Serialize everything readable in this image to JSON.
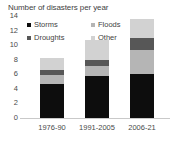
{
  "chart_data": {
    "type": "bar",
    "subtype": "stacked-bar",
    "title": "Number of disasters per year",
    "xlabel": "",
    "ylabel": "",
    "categories": [
      "1976-90",
      "1991-2005",
      "2006-21"
    ],
    "series": [
      {
        "name": "Storms",
        "color": "#0d0d0d",
        "values": [
          4.7,
          5.7,
          6.0
        ]
      },
      {
        "name": "Floods",
        "color": "#b5b5b5",
        "values": [
          1.2,
          1.4,
          3.4
        ]
      },
      {
        "name": "Droughts",
        "color": "#575757",
        "values": [
          0.7,
          0.8,
          1.6
        ]
      },
      {
        "name": "Other",
        "color": "#d2d2d2",
        "values": [
          1.6,
          2.8,
          2.6
        ]
      }
    ],
    "totals": [
      8.2,
      10.7,
      13.6
    ],
    "ylim": [
      0,
      14
    ],
    "yticks": [
      0,
      2,
      4,
      6,
      8,
      10,
      12,
      14
    ],
    "ytick_labels": [
      "0",
      "2",
      "4",
      "6",
      "8",
      "10",
      "12",
      "14"
    ],
    "grid": false,
    "legend_position": "inside-top-left",
    "legend_entries": [
      "Storms",
      "Floods",
      "Droughts",
      "Other"
    ],
    "axis_color": "#c9c9c9",
    "text_color": "#3f3f3f"
  }
}
